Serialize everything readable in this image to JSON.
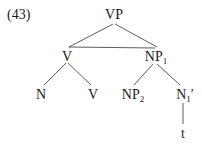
{
  "example_number": "(43)",
  "tree": {
    "root": {
      "label": "VP"
    },
    "level1": [
      {
        "label": "V",
        "sub": "",
        "prime": ""
      },
      {
        "label": "NP",
        "sub": "1",
        "prime": ""
      }
    ],
    "level2": [
      {
        "label": "N",
        "sub": "",
        "prime": ""
      },
      {
        "label": "V",
        "sub": "",
        "prime": ""
      },
      {
        "label": "NP",
        "sub": "2",
        "prime": ""
      },
      {
        "label": "N",
        "sub": "1",
        "prime": "′"
      }
    ],
    "level3": [
      {
        "label": "t"
      }
    ]
  },
  "colors": {
    "ink": "#1a1a1a",
    "background": "#ffffff"
  }
}
